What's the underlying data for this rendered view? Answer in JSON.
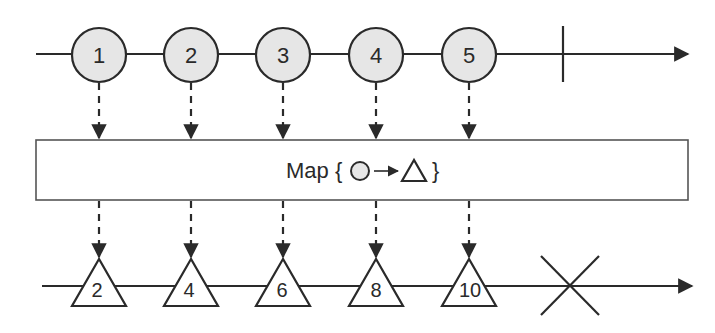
{
  "diagram": {
    "type": "marble-diagram",
    "operator_label": "Map {",
    "operator_close": "}",
    "operator_symbol_from": "circle",
    "operator_symbol_to": "triangle",
    "colors": {
      "stroke": "#2a2a2a",
      "marble_fill": "#e6e6e6",
      "background": "#ffffff"
    },
    "input_stream": {
      "items": [
        {
          "label": "1",
          "x": 99
        },
        {
          "label": "2",
          "x": 191
        },
        {
          "label": "3",
          "x": 283
        },
        {
          "label": "4",
          "x": 376
        },
        {
          "label": "5",
          "x": 469
        }
      ],
      "terminator": "completion",
      "terminator_x": 563
    },
    "output_stream": {
      "items": [
        {
          "label": "2",
          "x": 99
        },
        {
          "label": "4",
          "x": 191
        },
        {
          "label": "6",
          "x": 283
        },
        {
          "label": "8",
          "x": 376
        },
        {
          "label": "10",
          "x": 469
        }
      ],
      "terminator": "error",
      "terminator_x": 570
    }
  }
}
